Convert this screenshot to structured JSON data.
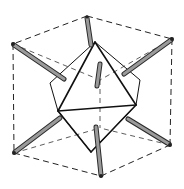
{
  "figure": {
    "colors": {
      "background": "#ffffff",
      "line": "#111111",
      "rod_fill": "#9a9a9a",
      "rod_outline": "#2a2a2a"
    },
    "cube_vertices": {
      "top_back": [
        87,
        16
      ],
      "top_left": [
        13,
        44
      ],
      "top_right": [
        172,
        39
      ],
      "bottom_left": [
        14,
        153
      ],
      "bottom_front": [
        101,
        176
      ],
      "bottom_right": [
        170,
        145
      ],
      "hidden_top": [
        100,
        80
      ],
      "hidden_bottom": [
        100,
        128
      ]
    },
    "octahedron_vertices": {
      "top": [
        95,
        42
      ],
      "left": [
        58,
        111
      ],
      "right": [
        136,
        105
      ],
      "bottom": [
        91,
        152
      ],
      "back_left": [
        50,
        83
      ],
      "front_right": [
        140,
        80
      ]
    },
    "rods": [
      {
        "name": "rod-top",
        "from": [
          87,
          18
        ],
        "to": [
          91,
          45
        ]
      },
      {
        "name": "rod-upper-left",
        "from": [
          14,
          45
        ],
        "to": [
          64,
          79
        ]
      },
      {
        "name": "rod-upper-right",
        "from": [
          171,
          40
        ],
        "to": [
          124,
          74
        ]
      },
      {
        "name": "rod-center",
        "from": [
          100,
          64
        ],
        "to": [
          97,
          86
        ]
      },
      {
        "name": "rod-lower-left",
        "from": [
          15,
          152
        ],
        "to": [
          60,
          118
        ]
      },
      {
        "name": "rod-lower-right",
        "from": [
          169,
          144
        ],
        "to": [
          128,
          119
        ]
      },
      {
        "name": "rod-bottom",
        "from": [
          96,
          127
        ],
        "to": [
          101,
          175
        ]
      }
    ]
  }
}
